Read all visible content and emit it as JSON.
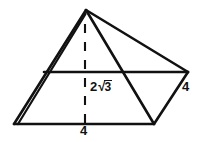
{
  "figure": {
    "type": "geometry-diagram",
    "background_color": "#ffffff",
    "stroke_color": "#111111",
    "labels": {
      "height": {
        "name": "height-label",
        "full_text": "2√3",
        "coefficient": "2",
        "radical_sign": "√",
        "radicand": "3",
        "describes": "pyramid vertical height (dashed segment)"
      },
      "slant_edge": {
        "name": "slant-edge-label",
        "text": "4",
        "describes": "right lateral edge length"
      },
      "base_edge": {
        "name": "base-edge-label",
        "text": "4",
        "describes": "front base edge length"
      }
    },
    "vertices": {
      "apex": [
        86,
        10
      ],
      "base_front_left": [
        14,
        124
      ],
      "base_front_right": [
        154,
        124
      ],
      "base_right": [
        188,
        72
      ],
      "base_back_left": [
        44,
        72
      ]
    },
    "edges": [
      {
        "name": "edge-apex-to-front-left-outer",
        "from": [
          86,
          10
        ],
        "to": [
          14,
          124
        ]
      },
      {
        "name": "edge-apex-to-front-left-inner",
        "from": [
          85,
          13
        ],
        "to": [
          17,
          124
        ]
      },
      {
        "name": "edge-apex-to-base-right",
        "from": [
          86,
          10
        ],
        "to": [
          188,
          72
        ]
      },
      {
        "name": "edge-apex-to-front-right",
        "from": [
          86,
          10
        ],
        "to": [
          154,
          124
        ]
      },
      {
        "name": "edge-base-front",
        "from": [
          14,
          124
        ],
        "to": [
          154,
          124
        ]
      },
      {
        "name": "edge-base-front-right-to-right",
        "from": [
          154,
          124
        ],
        "to": [
          188,
          72
        ]
      },
      {
        "name": "edge-base-back",
        "from": [
          44,
          72
        ],
        "to": [
          188,
          72
        ]
      }
    ],
    "dashed_edge": {
      "name": "pyramid-altitude",
      "from": [
        85,
        24
      ],
      "to": [
        85,
        124
      ],
      "style": "dashed"
    }
  }
}
